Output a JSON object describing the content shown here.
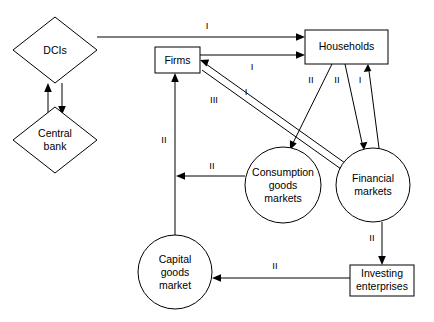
{
  "diagram": {
    "background_color": "#ffffff",
    "line_color": "#000000",
    "nodes": [
      {
        "id": "dcis",
        "shape": "diamond",
        "label": "DCIs",
        "lines": [
          "DCIs"
        ],
        "cx": 55,
        "cy": 50,
        "rx": 42,
        "ry": 33
      },
      {
        "id": "central_bank",
        "shape": "diamond",
        "label": "Central bank",
        "lines": [
          "Central",
          "bank"
        ],
        "cx": 55,
        "cy": 140,
        "rx": 42,
        "ry": 33
      },
      {
        "id": "firms",
        "shape": "rectangle",
        "label": "Firms",
        "lines": [
          "Firms"
        ],
        "x": 155,
        "y": 47,
        "w": 45,
        "h": 26
      },
      {
        "id": "households",
        "shape": "rectangle",
        "label": "Households",
        "lines": [
          "Households"
        ],
        "x": 305,
        "y": 30,
        "w": 83,
        "h": 34
      },
      {
        "id": "consumption",
        "shape": "circle",
        "label": "Consumption goods markets",
        "lines": [
          "Consumption",
          "goods",
          "markets"
        ],
        "cx": 283,
        "cy": 185,
        "r": 38
      },
      {
        "id": "financial",
        "shape": "circle",
        "label": "Financial markets",
        "lines": [
          "Financial",
          "markets"
        ],
        "cx": 373,
        "cy": 185,
        "r": 37
      },
      {
        "id": "capital",
        "shape": "circle",
        "label": "Capital goods market",
        "lines": [
          "Capital",
          "goods",
          "market"
        ],
        "cx": 175,
        "cy": 272,
        "r": 37
      },
      {
        "id": "investing",
        "shape": "rectangle",
        "label": "Investing enterprises",
        "lines": [
          "Investing",
          "enterprises"
        ],
        "x": 350,
        "y": 265,
        "w": 64,
        "h": 31
      }
    ],
    "edges": [
      {
        "id": "dcis-to-households",
        "from": "dcis",
        "to": "households",
        "label": "I",
        "label_x": 207,
        "label_y": 26
      },
      {
        "id": "firms-to-households",
        "from": "firms",
        "to": "households",
        "label": "I",
        "label_x": 252,
        "label_y": 64
      },
      {
        "id": "dcis-to-central-bank",
        "from": "dcis",
        "to": "central_bank",
        "label": "",
        "label_x": 0,
        "label_y": 0
      },
      {
        "id": "central-bank-to-dcis",
        "from": "central_bank",
        "to": "dcis",
        "label": "",
        "label_x": 0,
        "label_y": 0
      },
      {
        "id": "capital-to-firms",
        "from": "capital",
        "to": "firms",
        "label": "II",
        "label_x": 165,
        "label_y": 140
      },
      {
        "id": "consumption-to-firms",
        "from": "consumption",
        "to": "firms",
        "label": "II",
        "label_x": 212,
        "label_y": 170
      },
      {
        "id": "households-to-consumption",
        "from": "households",
        "to": "consumption",
        "label": "II",
        "label_x": 311,
        "label_y": 80
      },
      {
        "id": "households-to-financial",
        "from": "households",
        "to": "financial",
        "label": "II",
        "label_x": 337,
        "label_y": 80
      },
      {
        "id": "financial-to-households",
        "from": "financial",
        "to": "households",
        "label": "I",
        "label_x": 359,
        "label_y": 80
      },
      {
        "id": "financial-to-firms",
        "from": "financial",
        "to": "firms",
        "label": "I",
        "label_x": 245,
        "label_y": 92
      },
      {
        "id": "firms-to-financial",
        "from": "firms",
        "to": "financial",
        "label": "III",
        "label_x": 215,
        "label_y": 100
      },
      {
        "id": "financial-to-investing",
        "from": "financial",
        "to": "investing",
        "label": "II",
        "label_x": 373,
        "label_y": 237
      },
      {
        "id": "investing-to-capital",
        "from": "investing",
        "to": "capital",
        "label": "II",
        "label_x": 275,
        "label_y": 264
      }
    ]
  }
}
